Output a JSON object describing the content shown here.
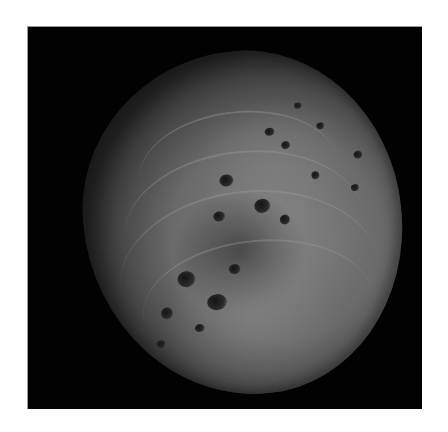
{
  "image": {
    "subject": "asteroid",
    "description": "Grayscale photograph of a cratered asteroid against black space",
    "background_color": "#020202",
    "page_color": "#ffffff",
    "surface_colors": [
      "#858585",
      "#6a6a6a",
      "#4a4a4a",
      "#2e2e2e"
    ]
  },
  "craters": [
    {
      "x": 140,
      "y": 122,
      "w": 14,
      "h": 12
    },
    {
      "x": 172,
      "y": 150,
      "w": 16,
      "h": 14
    },
    {
      "x": 130,
      "y": 158,
      "w": 12,
      "h": 10
    },
    {
      "x": 88,
      "y": 214,
      "w": 18,
      "h": 16
    },
    {
      "x": 115,
      "y": 240,
      "w": 20,
      "h": 16
    },
    {
      "x": 140,
      "y": 212,
      "w": 12,
      "h": 10
    },
    {
      "x": 68,
      "y": 248,
      "w": 12,
      "h": 12
    },
    {
      "x": 190,
      "y": 80,
      "w": 10,
      "h": 8
    },
    {
      "x": 205,
      "y": 95,
      "w": 9,
      "h": 8
    },
    {
      "x": 232,
      "y": 128,
      "w": 8,
      "h": 8
    },
    {
      "x": 276,
      "y": 112,
      "w": 9,
      "h": 8
    },
    {
      "x": 242,
      "y": 80,
      "w": 8,
      "h": 7
    },
    {
      "x": 222,
      "y": 58,
      "w": 8,
      "h": 6
    },
    {
      "x": 270,
      "y": 145,
      "w": 8,
      "h": 7
    },
    {
      "x": 60,
      "y": 280,
      "w": 10,
      "h": 8
    },
    {
      "x": 196,
      "y": 168,
      "w": 10,
      "h": 10
    },
    {
      "x": 100,
      "y": 268,
      "w": 10,
      "h": 8
    }
  ],
  "ridges": [
    {
      "x": 60,
      "y": 60,
      "w": 200,
      "h": 120
    },
    {
      "x": 40,
      "y": 100,
      "w": 240,
      "h": 150
    },
    {
      "x": 30,
      "y": 140,
      "w": 260,
      "h": 170
    },
    {
      "x": 50,
      "y": 190,
      "w": 230,
      "h": 130
    }
  ]
}
